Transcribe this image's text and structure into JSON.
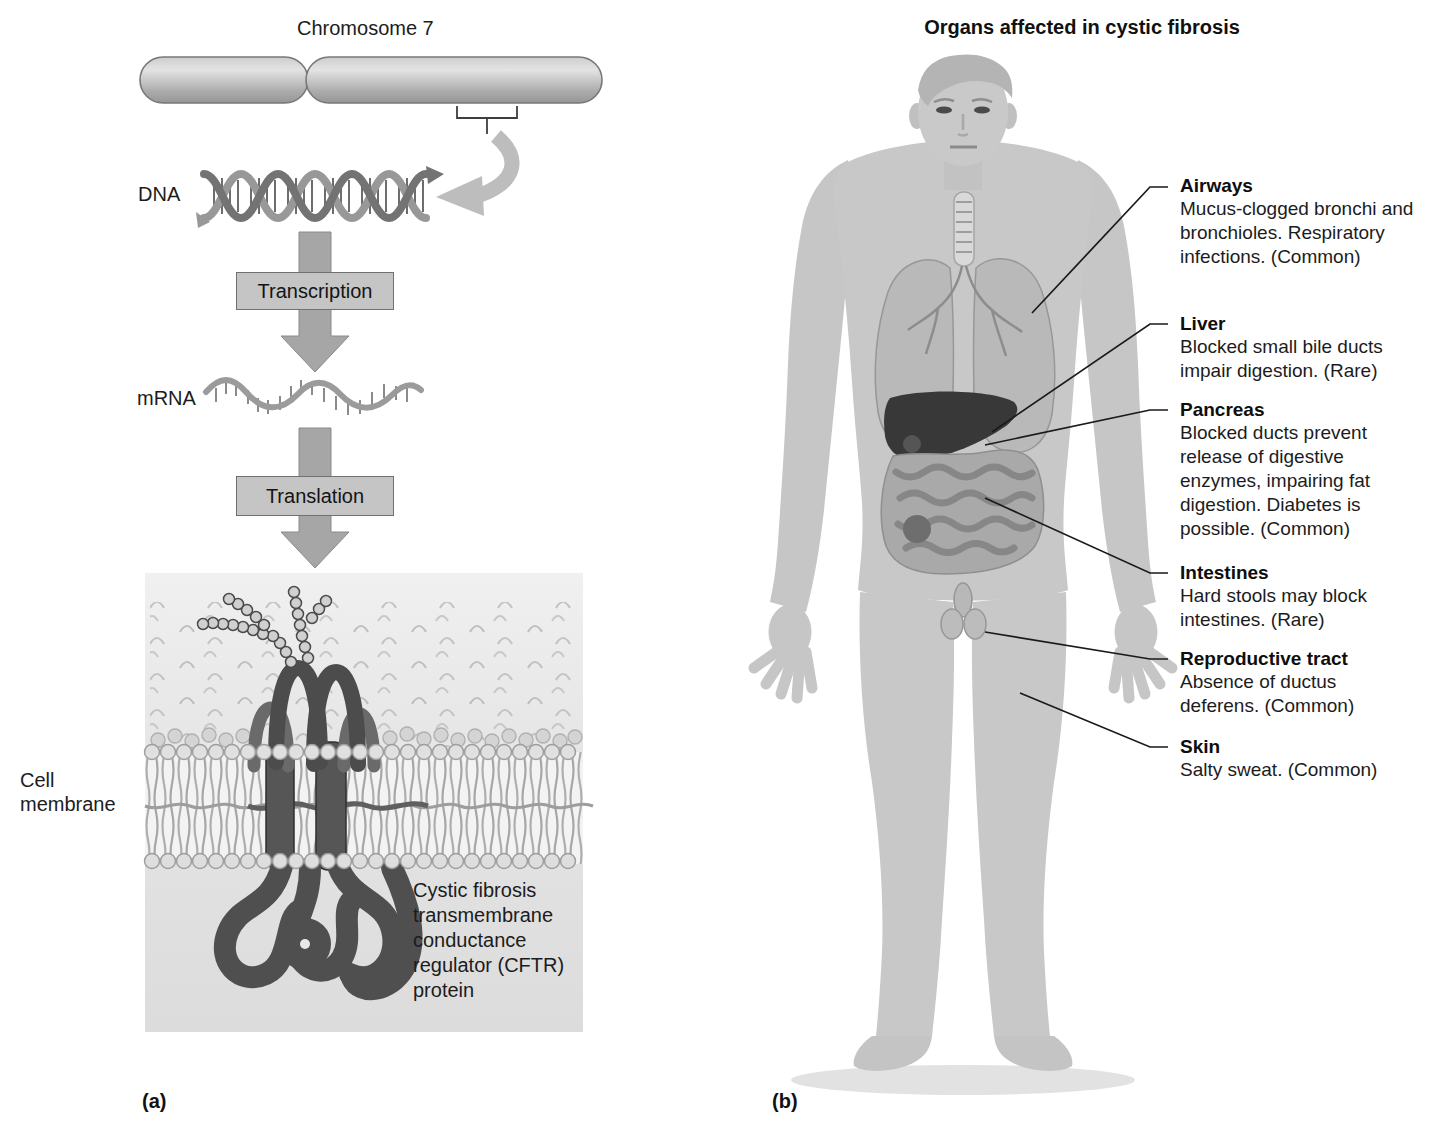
{
  "figure": {
    "panel_a": {
      "label": "(a)",
      "chromosome_label": "Chromosome 7",
      "dna_label": "DNA",
      "transcription_label": "Transcription",
      "mrna_label": "mRNA",
      "translation_label": "Translation",
      "cell_membrane_label": "Cell membrane",
      "protein_caption": "Cystic fibrosis transmembrane conductance regulator (CFTR) protein"
    },
    "panel_b": {
      "label": "(b)",
      "title": "Organs affected in cystic fibrosis",
      "organs": [
        {
          "name": "Airways",
          "description": "Mucus-clogged bronchi and bronchioles. Respiratory infections. (Common)"
        },
        {
          "name": "Liver",
          "description": "Blocked small bile ducts impair digestion. (Rare)"
        },
        {
          "name": "Pancreas",
          "description": "Blocked ducts prevent release of digestive enzymes, impairing fat digestion. Diabetes is possible. (Common)"
        },
        {
          "name": "Intestines",
          "description": "Hard stools may block intestines. (Rare)"
        },
        {
          "name": "Reproductive tract",
          "description": "Absence of ductus deferens. (Common)"
        },
        {
          "name": "Skin",
          "description": "Salty sweat. (Common)"
        }
      ]
    },
    "colors": {
      "background": "#ffffff",
      "diagram_gray": "#a6a6a6",
      "box_fill": "#c5c5c5",
      "box_border": "#707070",
      "membrane_bg": "#e4e4e4",
      "protein_dark": "#4f4f4f",
      "body_gray": "#c8c8c8",
      "liver_dark": "#383838",
      "leader_line": "#1a1a1a"
    }
  }
}
